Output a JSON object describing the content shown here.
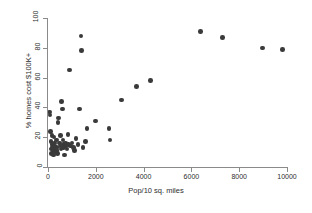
{
  "chart_data": {
    "type": "scatter",
    "title": "",
    "xlabel": "Pop/10 sq. miles",
    "ylabel": "% homes cost $100K+",
    "xlim": [
      0,
      10000
    ],
    "ylim": [
      0,
      100
    ],
    "xticks": [
      0,
      2000,
      4000,
      6000,
      8000,
      10000
    ],
    "yticks": [
      0,
      20,
      40,
      60,
      80,
      100
    ],
    "xtick_labels": [
      "0",
      "2000",
      "4000",
      "6000",
      "8000",
      "10000"
    ],
    "ytick_labels": [
      "0",
      "20",
      "40",
      "60",
      "80",
      "100"
    ],
    "grid": false,
    "legend": null,
    "marker_color": "#3a3a3a",
    "marker_size": 4.6,
    "points": [
      {
        "x": 60,
        "y": 37
      },
      {
        "x": 80,
        "y": 35
      },
      {
        "x": 105,
        "y": 24
      },
      {
        "x": 125,
        "y": 17
      },
      {
        "x": 140,
        "y": 12
      },
      {
        "x": 150,
        "y": 9
      },
      {
        "x": 170,
        "y": 21
      },
      {
        "x": 185,
        "y": 15
      },
      {
        "x": 200,
        "y": 13
      },
      {
        "x": 215,
        "y": 11
      },
      {
        "x": 230,
        "y": 8
      },
      {
        "x": 250,
        "y": 20
      },
      {
        "x": 265,
        "y": 16
      },
      {
        "x": 280,
        "y": 14
      },
      {
        "x": 300,
        "y": 12
      },
      {
        "x": 320,
        "y": 10
      },
      {
        "x": 345,
        "y": 18
      },
      {
        "x": 360,
        "y": 13
      },
      {
        "x": 380,
        "y": 11
      },
      {
        "x": 400,
        "y": 9
      },
      {
        "x": 420,
        "y": 30
      },
      {
        "x": 440,
        "y": 33
      },
      {
        "x": 470,
        "y": 16
      },
      {
        "x": 500,
        "y": 14
      },
      {
        "x": 520,
        "y": 21
      },
      {
        "x": 545,
        "y": 12
      },
      {
        "x": 570,
        "y": 44
      },
      {
        "x": 600,
        "y": 39
      },
      {
        "x": 620,
        "y": 18
      },
      {
        "x": 640,
        "y": 15
      },
      {
        "x": 660,
        "y": 13
      },
      {
        "x": 690,
        "y": 8
      },
      {
        "x": 720,
        "y": 16
      },
      {
        "x": 760,
        "y": 14
      },
      {
        "x": 800,
        "y": 12
      },
      {
        "x": 830,
        "y": 22
      },
      {
        "x": 870,
        "y": 15
      },
      {
        "x": 910,
        "y": 65
      },
      {
        "x": 950,
        "y": 14
      },
      {
        "x": 1000,
        "y": 16
      },
      {
        "x": 1060,
        "y": 13
      },
      {
        "x": 1100,
        "y": 11
      },
      {
        "x": 1180,
        "y": 19
      },
      {
        "x": 1250,
        "y": 15
      },
      {
        "x": 1320,
        "y": 39
      },
      {
        "x": 1380,
        "y": 88
      },
      {
        "x": 1400,
        "y": 78
      },
      {
        "x": 1470,
        "y": 13
      },
      {
        "x": 1560,
        "y": 17
      },
      {
        "x": 1640,
        "y": 26
      },
      {
        "x": 1980,
        "y": 31
      },
      {
        "x": 2560,
        "y": 26
      },
      {
        "x": 2600,
        "y": 18
      },
      {
        "x": 3080,
        "y": 45
      },
      {
        "x": 3700,
        "y": 54
      },
      {
        "x": 4280,
        "y": 58
      },
      {
        "x": 6380,
        "y": 91
      },
      {
        "x": 7300,
        "y": 87
      },
      {
        "x": 8970,
        "y": 80
      },
      {
        "x": 9820,
        "y": 79
      }
    ]
  }
}
